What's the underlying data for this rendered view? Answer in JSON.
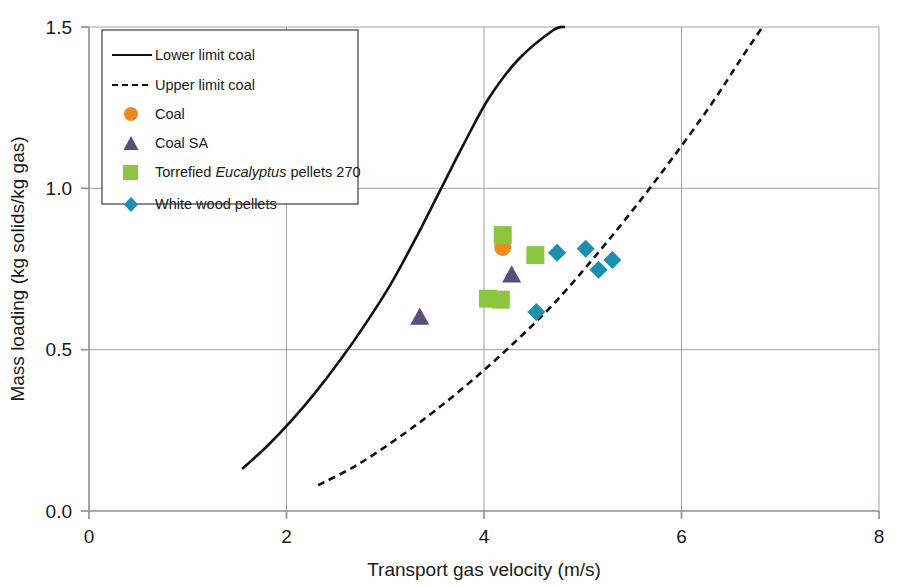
{
  "chart_data": {
    "type": "scatter",
    "title": "",
    "xlabel": "Transport gas velocity (m/s)",
    "ylabel": "Mass loading (kg solids/kg gas)",
    "xlim": [
      0,
      8
    ],
    "ylim": [
      0.0,
      1.5
    ],
    "xticks": [
      "0",
      "2",
      "4",
      "6",
      "8"
    ],
    "xtick_values": [
      0,
      2,
      4,
      6,
      8
    ],
    "yticks": [
      "0.0",
      "0.5",
      "1.0",
      "1.5"
    ],
    "ytick_values": [
      0.0,
      0.5,
      1.0,
      1.5
    ],
    "grid": "both",
    "legend_position": "top-left-inside",
    "series": [
      {
        "name": "Lower limit coal",
        "marker": "line-solid",
        "color": "#111111",
        "style": "solid",
        "points": [
          [
            1.55,
            0.13
          ],
          [
            1.8,
            0.2
          ],
          [
            2.05,
            0.28
          ],
          [
            2.3,
            0.37
          ],
          [
            2.55,
            0.47
          ],
          [
            2.8,
            0.58
          ],
          [
            3.05,
            0.7
          ],
          [
            3.3,
            0.84
          ],
          [
            3.55,
            0.99
          ],
          [
            3.8,
            1.14
          ],
          [
            4.05,
            1.28
          ],
          [
            4.35,
            1.4
          ],
          [
            4.7,
            1.49
          ],
          [
            4.82,
            1.5
          ]
        ]
      },
      {
        "name": "Upper limit coal",
        "marker": "line-dashed",
        "color": "#111111",
        "style": "dashed",
        "points": [
          [
            2.32,
            0.08
          ],
          [
            2.7,
            0.14
          ],
          [
            3.1,
            0.22
          ],
          [
            3.5,
            0.31
          ],
          [
            3.9,
            0.41
          ],
          [
            4.3,
            0.52
          ],
          [
            4.7,
            0.64
          ],
          [
            5.1,
            0.78
          ],
          [
            5.5,
            0.93
          ],
          [
            5.9,
            1.09
          ],
          [
            6.3,
            1.26
          ],
          [
            6.6,
            1.4
          ],
          [
            6.82,
            1.5
          ]
        ]
      },
      {
        "name": "Coal",
        "marker": "circle",
        "color": "#ED8B22",
        "points": [
          [
            4.19,
            0.817
          ]
        ]
      },
      {
        "name": "Coal SA",
        "marker": "triangle",
        "color": "#5B4E7D",
        "points": [
          [
            3.35,
            0.601
          ],
          [
            4.28,
            0.732
          ]
        ]
      },
      {
        "name": "Torrefied Eucalyptus pellets 270",
        "marker": "square",
        "color": "#8CC63F",
        "points": [
          [
            4.19,
            0.855
          ],
          [
            4.52,
            0.793
          ],
          [
            4.04,
            0.658
          ],
          [
            4.17,
            0.655
          ]
        ]
      },
      {
        "name": "White wood pellets",
        "marker": "diamond",
        "color": "#1B8FAE",
        "points": [
          [
            4.74,
            0.8
          ],
          [
            5.03,
            0.813
          ],
          [
            5.3,
            0.778
          ],
          [
            5.16,
            0.748
          ],
          [
            4.53,
            0.617
          ]
        ]
      }
    ],
    "legend": [
      {
        "label": "Lower limit coal",
        "marker": "line-solid",
        "color": "#111111"
      },
      {
        "label": "Upper limit coal",
        "marker": "line-dashed",
        "color": "#111111"
      },
      {
        "label": "Coal",
        "marker": "circle",
        "color": "#ED8B22"
      },
      {
        "label": "Coal SA",
        "marker": "triangle",
        "color": "#5B4E7D"
      },
      {
        "label": "Torrefied Eucalyptus pellets 270",
        "marker": "square",
        "color": "#8CC63F",
        "italic_word": "Eucalyptus"
      },
      {
        "label": "White wood pellets",
        "marker": "diamond",
        "color": "#1B8FAE"
      }
    ]
  },
  "axes": {
    "x_title": "Transport gas velocity (m/s)",
    "y_title": "Mass loading (kg solids/kg gas)",
    "x_tick_0": "0",
    "x_tick_1": "2",
    "x_tick_2": "4",
    "x_tick_3": "6",
    "x_tick_4": "8",
    "y_tick_0": "0.0",
    "y_tick_1": "0.5",
    "y_tick_2": "1.0",
    "y_tick_3": "1.5"
  },
  "legend_text": {
    "item0": "Lower limit coal",
    "item1": "Upper limit coal",
    "item2": "Coal",
    "item3": "Coal SA",
    "item4_pre": "Torrefied ",
    "item4_ital": "Eucalyptus",
    "item4_post": " pellets 270",
    "item5": "White wood pellets"
  },
  "colors": {
    "coal": "#ED8B22",
    "coal_sa": "#5B4E7D",
    "torrefied": "#8CC63F",
    "white_wood": "#1B8FAE",
    "axis": "#8a9099",
    "grid": "#9aa3ae",
    "curve": "#111111"
  }
}
